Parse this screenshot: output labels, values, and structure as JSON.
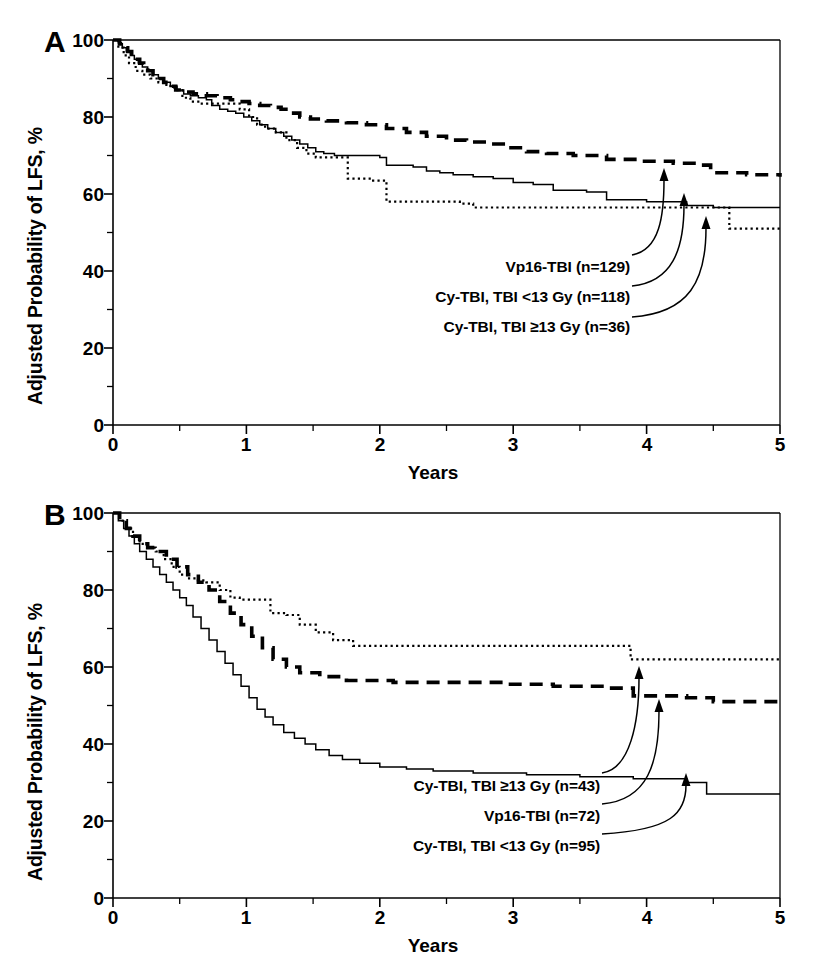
{
  "figure": {
    "background": "#ffffff",
    "ink": "#000000"
  },
  "panels": [
    {
      "id": "A",
      "letter": "A",
      "ylabel": "Adjusted Probability of LFS, %",
      "xlabel": "Years",
      "yticks": [
        "0",
        "20",
        "40",
        "60",
        "80",
        "100"
      ],
      "xticks": [
        "0",
        "1",
        "2",
        "3",
        "4",
        "5"
      ],
      "annotations": [
        {
          "text": "Vp16-TBI (n=129)",
          "target": "vp16-tbi"
        },
        {
          "text": "Cy-TBI, TBI <13 Gy (n=118)",
          "target": "cy-tbi-low"
        },
        {
          "text": "Cy-TBI, TBI ≥13 Gy (n=36)",
          "target": "cy-tbi-high"
        }
      ]
    },
    {
      "id": "B",
      "letter": "B",
      "ylabel": "Adjusted Probability of LFS, %",
      "xlabel": "Years",
      "yticks": [
        "0",
        "20",
        "40",
        "60",
        "80",
        "100"
      ],
      "xticks": [
        "0",
        "1",
        "2",
        "3",
        "4",
        "5"
      ],
      "annotations": [
        {
          "text": "Cy-TBI, TBI ≥13 Gy (n=43)",
          "target": "cy-tbi-high"
        },
        {
          "text": "Vp16-TBI (n=72)",
          "target": "vp16-tbi"
        },
        {
          "text": "Cy-TBI, TBI <13 Gy (n=95)",
          "target": "cy-tbi-low"
        }
      ]
    }
  ],
  "chart_data": [
    {
      "type": "line",
      "title": "A",
      "xlabel": "Years",
      "ylabel": "Adjusted Probability of LFS, %",
      "xlim": [
        0,
        5
      ],
      "ylim": [
        0,
        100
      ],
      "xticks": [
        0,
        1,
        2,
        3,
        4,
        5
      ],
      "yticks": [
        0,
        20,
        40,
        60,
        80,
        100
      ],
      "minor_xticks": [
        0.5,
        1.5,
        2.5,
        3.5,
        4.5
      ],
      "minor_yticks": [
        10,
        30,
        50,
        70,
        90
      ],
      "grid": false,
      "legend": "inline-annotations-with-arrows",
      "series": [
        {
          "name": "Vp16-TBI (n=129)",
          "n": 129,
          "style": "dashed",
          "final_value": 64.5,
          "points": [
            [
              0.0,
              100
            ],
            [
              0.05,
              99
            ],
            [
              0.08,
              98
            ],
            [
              0.11,
              97
            ],
            [
              0.14,
              96
            ],
            [
              0.17,
              95
            ],
            [
              0.2,
              94
            ],
            [
              0.23,
              93
            ],
            [
              0.26,
              92
            ],
            [
              0.3,
              91
            ],
            [
              0.34,
              90
            ],
            [
              0.38,
              89
            ],
            [
              0.42,
              88
            ],
            [
              0.47,
              87
            ],
            [
              0.52,
              86.5
            ],
            [
              0.6,
              86
            ],
            [
              0.7,
              85.5
            ],
            [
              0.78,
              85
            ],
            [
              0.88,
              84.5
            ],
            [
              0.95,
              84
            ],
            [
              1.02,
              83.5
            ],
            [
              1.1,
              83
            ],
            [
              1.18,
              82.5
            ],
            [
              1.26,
              82
            ],
            [
              1.33,
              81
            ],
            [
              1.4,
              80
            ],
            [
              1.48,
              79.5
            ],
            [
              1.6,
              79
            ],
            [
              1.75,
              78.5
            ],
            [
              1.9,
              78
            ],
            [
              2.05,
              77
            ],
            [
              2.2,
              76
            ],
            [
              2.35,
              75
            ],
            [
              2.5,
              74
            ],
            [
              2.65,
              73.5
            ],
            [
              2.8,
              73
            ],
            [
              2.95,
              72
            ],
            [
              3.1,
              71
            ],
            [
              3.25,
              70.5
            ],
            [
              3.45,
              70
            ],
            [
              3.7,
              69
            ],
            [
              3.95,
              68.5
            ],
            [
              4.2,
              68
            ],
            [
              4.4,
              67.5
            ],
            [
              4.48,
              65.5
            ],
            [
              4.75,
              65
            ],
            [
              5.0,
              64.5
            ]
          ]
        },
        {
          "name": "Cy-TBI, TBI <13 Gy (n=118)",
          "n": 118,
          "style": "solid",
          "final_value": 56.5,
          "points": [
            [
              0.0,
              100
            ],
            [
              0.04,
              99
            ],
            [
              0.07,
              98
            ],
            [
              0.1,
              97
            ],
            [
              0.13,
              96
            ],
            [
              0.16,
              95
            ],
            [
              0.19,
              94
            ],
            [
              0.22,
              93
            ],
            [
              0.26,
              92
            ],
            [
              0.3,
              91
            ],
            [
              0.34,
              90
            ],
            [
              0.38,
              89
            ],
            [
              0.43,
              88
            ],
            [
              0.48,
              87
            ],
            [
              0.53,
              86
            ],
            [
              0.58,
              85.5
            ],
            [
              0.64,
              85
            ],
            [
              0.7,
              84.5
            ],
            [
              0.74,
              83
            ],
            [
              0.8,
              82
            ],
            [
              0.86,
              81.5
            ],
            [
              0.92,
              81
            ],
            [
              0.98,
              80
            ],
            [
              1.04,
              79
            ],
            [
              1.1,
              78
            ],
            [
              1.16,
              77
            ],
            [
              1.22,
              76
            ],
            [
              1.28,
              75
            ],
            [
              1.34,
              74
            ],
            [
              1.4,
              73
            ],
            [
              1.46,
              72
            ],
            [
              1.52,
              71
            ],
            [
              1.58,
              70.5
            ],
            [
              1.66,
              70
            ],
            [
              1.9,
              70
            ],
            [
              2.0,
              69.5
            ],
            [
              2.05,
              67.5
            ],
            [
              2.25,
              67
            ],
            [
              2.35,
              66
            ],
            [
              2.45,
              65.5
            ],
            [
              2.55,
              65
            ],
            [
              2.7,
              64.5
            ],
            [
              2.85,
              64
            ],
            [
              3.0,
              63
            ],
            [
              3.15,
              62.5
            ],
            [
              3.3,
              61
            ],
            [
              3.55,
              60.5
            ],
            [
              3.7,
              58.5
            ],
            [
              4.0,
              58
            ],
            [
              4.3,
              57
            ],
            [
              4.5,
              56.5
            ],
            [
              5.0,
              56.5
            ]
          ]
        },
        {
          "name": "Cy-TBI, TBI ≥13 Gy (n=36)",
          "n": 36,
          "style": "dotted",
          "final_value": 51,
          "points": [
            [
              0.0,
              100
            ],
            [
              0.04,
              98
            ],
            [
              0.08,
              96
            ],
            [
              0.12,
              94
            ],
            [
              0.17,
              92
            ],
            [
              0.22,
              91
            ],
            [
              0.28,
              90
            ],
            [
              0.34,
              89
            ],
            [
              0.4,
              88
            ],
            [
              0.46,
              87
            ],
            [
              0.52,
              85
            ],
            [
              0.58,
              84
            ],
            [
              0.65,
              83.5
            ],
            [
              0.9,
              83.5
            ],
            [
              0.95,
              82
            ],
            [
              1.02,
              80
            ],
            [
              1.08,
              78
            ],
            [
              1.14,
              77
            ],
            [
              1.22,
              76
            ],
            [
              1.3,
              74
            ],
            [
              1.38,
              72
            ],
            [
              1.45,
              70.5
            ],
            [
              1.52,
              69.5
            ],
            [
              1.7,
              69.5
            ],
            [
              1.76,
              64
            ],
            [
              1.95,
              63.5
            ],
            [
              2.05,
              58
            ],
            [
              2.6,
              57.5
            ],
            [
              2.7,
              56.5
            ],
            [
              4.5,
              56.5
            ],
            [
              4.62,
              51
            ],
            [
              5.0,
              51
            ]
          ]
        }
      ]
    },
    {
      "type": "line",
      "title": "B",
      "xlabel": "Years",
      "ylabel": "Adjusted Probability of LFS, %",
      "xlim": [
        0,
        5
      ],
      "ylim": [
        0,
        100
      ],
      "xticks": [
        0,
        1,
        2,
        3,
        4,
        5
      ],
      "yticks": [
        0,
        20,
        40,
        60,
        80,
        100
      ],
      "minor_xticks": [
        0.5,
        1.5,
        2.5,
        3.5,
        4.5
      ],
      "minor_yticks": [
        10,
        30,
        50,
        70,
        90
      ],
      "grid": false,
      "legend": "inline-annotations-with-arrows",
      "series": [
        {
          "name": "Cy-TBI, TBI ≥13 Gy (n=43)",
          "n": 43,
          "style": "dotted",
          "final_value": 62,
          "points": [
            [
              0.0,
              100
            ],
            [
              0.05,
              98
            ],
            [
              0.1,
              96
            ],
            [
              0.15,
              94
            ],
            [
              0.2,
              92
            ],
            [
              0.26,
              91
            ],
            [
              0.32,
              90
            ],
            [
              0.38,
              88
            ],
            [
              0.44,
              86
            ],
            [
              0.5,
              84
            ],
            [
              0.56,
              83
            ],
            [
              0.62,
              82.5
            ],
            [
              0.7,
              82
            ],
            [
              0.8,
              80
            ],
            [
              0.88,
              78
            ],
            [
              0.95,
              77.5
            ],
            [
              1.1,
              77.5
            ],
            [
              1.18,
              74
            ],
            [
              1.3,
              73.5
            ],
            [
              1.4,
              71
            ],
            [
              1.52,
              69
            ],
            [
              1.65,
              67
            ],
            [
              1.8,
              65.5
            ],
            [
              3.8,
              65.5
            ],
            [
              3.88,
              62
            ],
            [
              5.0,
              62
            ]
          ]
        },
        {
          "name": "Vp16-TBI (n=72)",
          "n": 72,
          "style": "dashed",
          "final_value": 50.5,
          "points": [
            [
              0.0,
              100
            ],
            [
              0.05,
              98
            ],
            [
              0.1,
              96
            ],
            [
              0.15,
              94
            ],
            [
              0.2,
              92
            ],
            [
              0.26,
              91
            ],
            [
              0.32,
              90
            ],
            [
              0.4,
              88
            ],
            [
              0.48,
              86
            ],
            [
              0.56,
              84
            ],
            [
              0.64,
              82
            ],
            [
              0.72,
              80
            ],
            [
              0.8,
              77
            ],
            [
              0.88,
              74
            ],
            [
              0.96,
              71
            ],
            [
              1.04,
              68
            ],
            [
              1.12,
              65
            ],
            [
              1.2,
              62
            ],
            [
              1.3,
              60
            ],
            [
              1.4,
              58.5
            ],
            [
              1.55,
              57.5
            ],
            [
              1.75,
              56.5
            ],
            [
              2.1,
              56
            ],
            [
              2.6,
              56
            ],
            [
              2.95,
              55.5
            ],
            [
              3.3,
              55
            ],
            [
              3.7,
              54.5
            ],
            [
              3.9,
              52.5
            ],
            [
              4.3,
              52
            ],
            [
              4.5,
              51
            ],
            [
              5.0,
              50.5
            ]
          ]
        },
        {
          "name": "Cy-TBI, TBI <13 Gy (n=95)",
          "n": 95,
          "style": "solid",
          "final_value": 27,
          "points": [
            [
              0.0,
              100
            ],
            [
              0.04,
              98
            ],
            [
              0.08,
              96
            ],
            [
              0.12,
              94
            ],
            [
              0.16,
              92
            ],
            [
              0.2,
              90
            ],
            [
              0.25,
              88
            ],
            [
              0.3,
              86
            ],
            [
              0.35,
              84
            ],
            [
              0.4,
              82
            ],
            [
              0.45,
              80
            ],
            [
              0.5,
              78
            ],
            [
              0.55,
              76
            ],
            [
              0.6,
              73
            ],
            [
              0.66,
              70
            ],
            [
              0.72,
              67
            ],
            [
              0.78,
              64
            ],
            [
              0.84,
              61
            ],
            [
              0.9,
              58
            ],
            [
              0.96,
              55
            ],
            [
              1.02,
              52
            ],
            [
              1.08,
              49
            ],
            [
              1.14,
              47
            ],
            [
              1.2,
              45
            ],
            [
              1.28,
              43
            ],
            [
              1.36,
              41.5
            ],
            [
              1.44,
              40
            ],
            [
              1.52,
              38.5
            ],
            [
              1.62,
              37
            ],
            [
              1.72,
              36
            ],
            [
              1.85,
              35
            ],
            [
              2.0,
              34
            ],
            [
              2.2,
              33.5
            ],
            [
              2.4,
              33
            ],
            [
              2.7,
              32.5
            ],
            [
              3.1,
              32
            ],
            [
              3.5,
              31.5
            ],
            [
              3.9,
              31
            ],
            [
              4.3,
              30
            ],
            [
              4.45,
              27
            ],
            [
              5.0,
              27
            ]
          ]
        }
      ]
    }
  ]
}
